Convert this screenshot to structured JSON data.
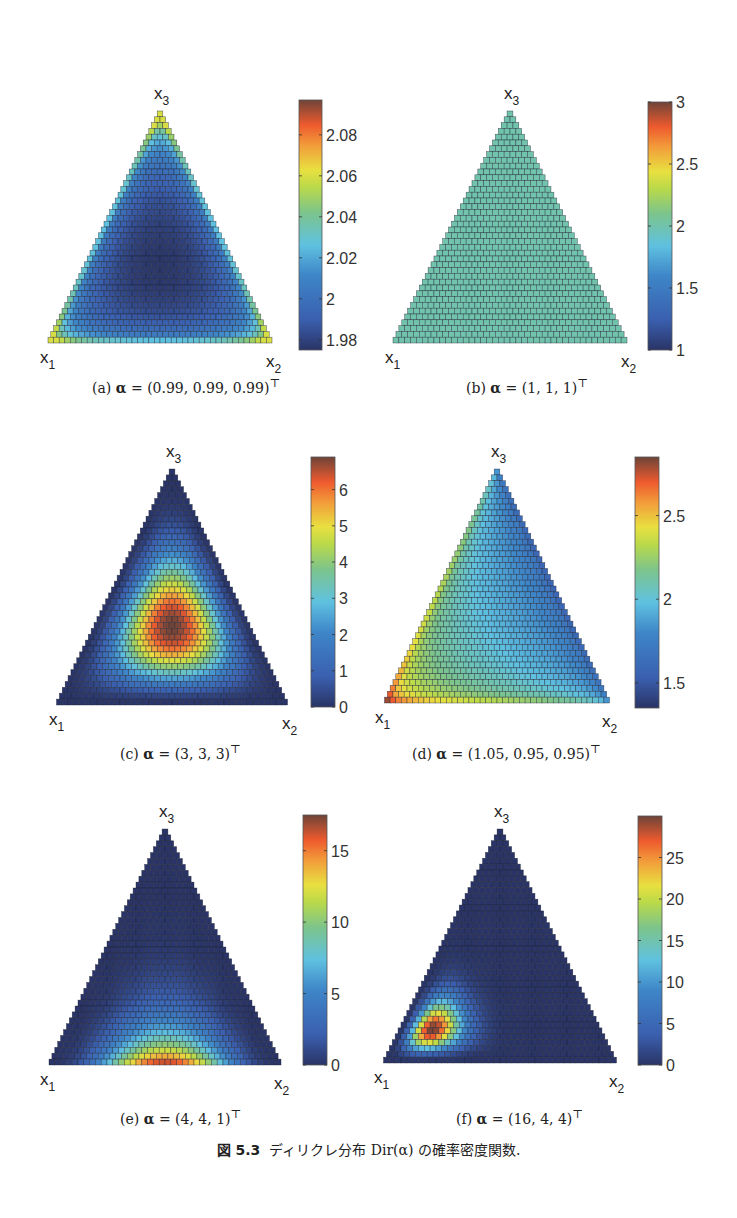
{
  "figure": {
    "number": "図 5.3",
    "title": "ディリクレ分布 Dir(α) の確率密度関数."
  },
  "chart_data": [
    {
      "type": "heatmap",
      "panel": "a",
      "caption": "(a) α = (0.99, 0.99, 0.99)ᵀ",
      "alpha": [
        0.99,
        0.99,
        0.99
      ],
      "vertex_labels": {
        "x1": "x",
        "x1_sub": "1",
        "x2": "x",
        "x2_sub": "2",
        "x3": "x",
        "x3_sub": "3"
      },
      "colorbar": {
        "min": 1.975,
        "max": 2.097,
        "ticks": [
          1.98,
          2,
          2.02,
          2.04,
          2.06,
          2.08
        ],
        "tick_labels": [
          "1.98",
          "2",
          "2.02",
          "2.04",
          "2.06",
          "2.08"
        ]
      },
      "clip": [
        1.975,
        2.06
      ]
    },
    {
      "type": "heatmap",
      "panel": "b",
      "caption": "(b) α = (1, 1, 1)ᵀ",
      "alpha": [
        1,
        1,
        1
      ],
      "vertex_labels": {
        "x1": "x",
        "x1_sub": "1",
        "x2": "x",
        "x2_sub": "2",
        "x3": "x",
        "x3_sub": "3"
      },
      "colorbar": {
        "min": 1,
        "max": 3,
        "ticks": [
          1,
          1.5,
          2,
          2.5,
          3
        ],
        "tick_labels": [
          "1",
          "1.5",
          "2",
          "2.5",
          "3"
        ]
      },
      "clip": null
    },
    {
      "type": "heatmap",
      "panel": "c",
      "caption": "(c) α = (3, 3, 3)ᵀ",
      "alpha": [
        3,
        3,
        3
      ],
      "vertex_labels": {
        "x1": "x",
        "x1_sub": "1",
        "x2": "x",
        "x2_sub": "2",
        "x3": "x",
        "x3_sub": "3"
      },
      "colorbar": {
        "min": 0,
        "max": 6.9,
        "ticks": [
          0,
          1,
          2,
          3,
          4,
          5,
          6
        ],
        "tick_labels": [
          "0",
          "1",
          "2",
          "3",
          "4",
          "5",
          "6"
        ]
      },
      "clip": null
    },
    {
      "type": "heatmap",
      "panel": "d",
      "caption": "(d) α = (1.05, 0.95, 0.95)ᵀ",
      "alpha": [
        1.05,
        0.95,
        0.95
      ],
      "vertex_labels": {
        "x1": "x",
        "x1_sub": "1",
        "x2": "x",
        "x2_sub": "2",
        "x3": "x",
        "x3_sub": "3"
      },
      "colorbar": {
        "min": 1.35,
        "max": 2.85,
        "ticks": [
          1.5,
          2,
          2.5
        ],
        "tick_labels": [
          "1.5",
          "2",
          "2.5"
        ]
      },
      "clip": [
        1.35,
        2.8
      ]
    },
    {
      "type": "heatmap",
      "panel": "e",
      "caption": "(e) α = (4, 4, 1)ᵀ",
      "alpha": [
        4,
        4,
        1
      ],
      "vertex_labels": {
        "x1": "x",
        "x1_sub": "1",
        "x2": "x",
        "x2_sub": "2",
        "x3": "x",
        "x3_sub": "3"
      },
      "colorbar": {
        "min": 0,
        "max": 17.5,
        "ticks": [
          0,
          5,
          10,
          15
        ],
        "tick_labels": [
          "0",
          "5",
          "10",
          "15"
        ]
      },
      "clip": null
    },
    {
      "type": "heatmap",
      "panel": "f",
      "caption": "(f) α = (16, 4, 4)ᵀ",
      "alpha": [
        16,
        4,
        4
      ],
      "vertex_labels": {
        "x1": "x",
        "x1_sub": "1",
        "x2": "x",
        "x2_sub": "2",
        "x3": "x",
        "x3_sub": "3"
      },
      "colorbar": {
        "min": 0,
        "max": 30,
        "ticks": [
          0,
          5,
          10,
          15,
          20,
          25
        ],
        "tick_labels": [
          "0",
          "5",
          "10",
          "15",
          "20",
          "25"
        ]
      },
      "clip": null
    }
  ],
  "captions": {
    "a": {
      "label": "(a)",
      "alpha": "α",
      "eq": " = (0.99, 0.99, 0.99)",
      "sup": "⊤"
    },
    "b": {
      "label": "(b)",
      "alpha": "α",
      "eq": " = (1, 1, 1)",
      "sup": "⊤"
    },
    "c": {
      "label": "(c)",
      "alpha": "α",
      "eq": " = (3, 3, 3)",
      "sup": "⊤"
    },
    "d": {
      "label": "(d)",
      "alpha": "α",
      "eq": " = (1.05, 0.95, 0.95)",
      "sup": "⊤"
    },
    "e": {
      "label": "(e)",
      "alpha": "α",
      "eq": " = (4, 4, 1)",
      "sup": "⊤"
    },
    "f": {
      "label": "(f)",
      "alpha": "α",
      "eq": " = (16, 4, 4)",
      "sup": "⊤"
    }
  }
}
